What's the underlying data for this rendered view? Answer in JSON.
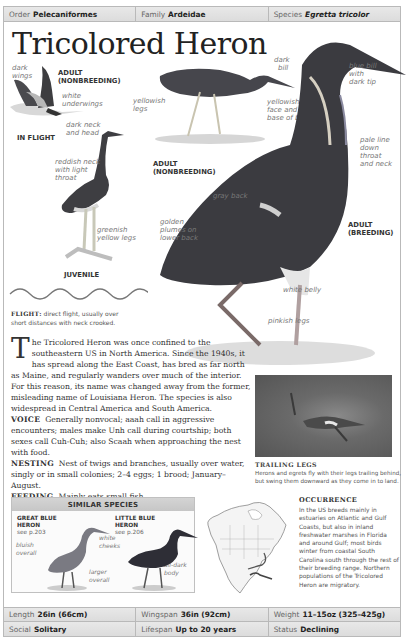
{
  "header": {
    "order_label": "Order",
    "order_value": "Pelecaniformes",
    "family_label": "Family",
    "family_value": "Ardeidae",
    "species_label": "Species",
    "species_value": "Egretta tricolor"
  },
  "title": "Tricolored Heron",
  "illustrations": {
    "in_flight": {
      "caption": "IN FLIGHT",
      "labels": [
        "dark",
        "wings",
        "white",
        "underwings",
        "dark neck",
        "and head"
      ],
      "age_caption_1": "ADULT",
      "age_caption_2": "(NONBREEDING)"
    },
    "adult_nonbreeding": {
      "caption_1": "ADULT",
      "caption_2": "(NONBREEDING)",
      "labels": [
        "yellowish",
        "legs",
        "dark",
        "bill",
        "yellowish",
        "face and",
        "base of bill"
      ]
    },
    "juvenile": {
      "caption": "JUVENILE",
      "labels": [
        "reddish neck",
        "with light",
        "throat",
        "greenish",
        "yellow legs"
      ]
    },
    "adult_breeding": {
      "caption_1": "ADULT",
      "caption_2": "(BREEDING)",
      "labels": [
        "blue bill",
        "with",
        "dark tip",
        "pale line",
        "down",
        "throat",
        "and neck",
        "gray back",
        "golden",
        "plumes on",
        "lower back",
        "white belly",
        "pinkish legs"
      ]
    }
  },
  "flight": {
    "label": "FLIGHT:",
    "text": "direct flight, usually over short distances with neck crooked."
  },
  "description": {
    "dropcap": "T",
    "text": "he Tricolored Heron was once confined to the southeastern US in North America. Since the 1940s, it has spread along the East Coast, has bred as far north as Maine, and regularly wanders over much of the interior. For this reason, its name was changed away from the former, misleading name of Louisiana Heron. The species is also widespread in Central America and South America.",
    "voice_label": "VOICE",
    "voice_text": "Generally nonvocal; aaah call in aggressive encounters; males make Unh call during courtship; both sexes call Cuh-Cuh; also Scaah when approaching the nest with food.",
    "nesting_label": "NESTING",
    "nesting_text": "Nest of twigs and branches, usually over water, singly or in small colonies; 2–4 eggs; 1 brood; January–August.",
    "feeding_label": "FEEDING",
    "feeding_text": "Mainly eats small fish."
  },
  "photo": {
    "title": "TRAILING LEGS",
    "caption": "Herons and egrets fly with their legs trailing behind, but swing them downward as they come in to land."
  },
  "similar_species": {
    "heading": "SIMILAR SPECIES",
    "species": [
      {
        "name_1": "GREAT BLUE",
        "name_2": "HERON",
        "ref": "see p.203",
        "labels": [
          "bluish",
          "overall",
          "white",
          "cheeks",
          "larger",
          "overall"
        ]
      },
      {
        "name_1": "LITTLE BLUE",
        "name_2": "HERON",
        "ref": "see p.206",
        "labels": [
          "all-dark",
          "body"
        ]
      }
    ]
  },
  "occurrence": {
    "title": "OCCURRENCE",
    "text": "In the US breeds mainly in estuaries on Atlantic and Gulf Coasts, but also in inland freshwater marshes in Florida and around Gulf; most birds winter from coastal South Carolina south through the rest of their breeding range. Northern populations of the Tricolored Heron are migratory."
  },
  "stats": {
    "row1": [
      {
        "label": "Length",
        "value": "26in (66cm)"
      },
      {
        "label": "Wingspan",
        "value": "36in (92cm)"
      },
      {
        "label": "Weight",
        "value": "11–15oz (325–425g)"
      }
    ],
    "row2": [
      {
        "label": "Social",
        "value": "Solitary"
      },
      {
        "label": "Lifespan",
        "value": "Up to 20 years"
      },
      {
        "label": "Status",
        "value": "Declining"
      }
    ]
  }
}
